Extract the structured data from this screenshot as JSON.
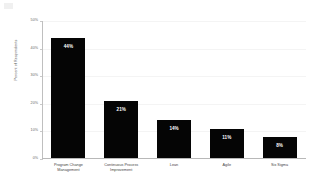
{
  "chart_data": {
    "type": "bar",
    "title": "",
    "xlabel": "",
    "ylabel": "Percent of Respondents",
    "categories": [
      "Program Change Management",
      "Continuous Process Improvement",
      "Lean",
      "Agile",
      "Six Sigma"
    ],
    "category_lines": [
      [
        "Program Change",
        "Management"
      ],
      [
        "Continuous Process",
        "Improvement"
      ],
      [
        "Lean"
      ],
      [
        "Agile"
      ],
      [
        "Six Sigma"
      ]
    ],
    "values": [
      44,
      21,
      14,
      11,
      8
    ],
    "value_labels": [
      "44%",
      "21%",
      "14%",
      "11%",
      "8%"
    ],
    "ylim": [
      0,
      50
    ],
    "ytick_values": [
      50,
      40,
      30,
      20,
      10,
      0
    ],
    "ytick_labels": [
      "50%",
      "40%",
      "30%",
      "20%",
      "10%",
      "0%"
    ],
    "grid": true,
    "legend": false,
    "bar_color": "#050505",
    "background_color": "#ffffff",
    "axis_color": "#bfbfbf",
    "gridline_color": "#f4f4f4",
    "label_text_color": "#ffffff"
  }
}
